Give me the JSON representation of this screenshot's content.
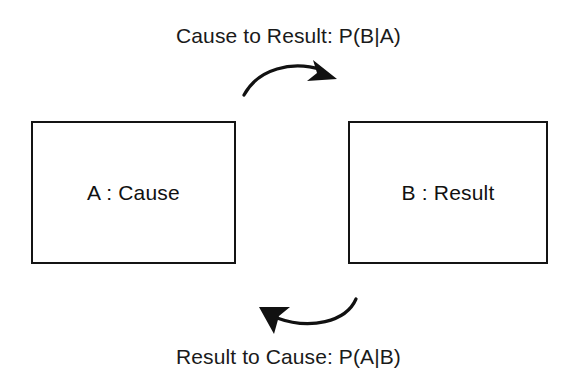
{
  "figure": {
    "background_color": "#ffffff",
    "ink_color": "#111111",
    "width": 577,
    "height": 384
  },
  "captions": {
    "top": "Cause to Result: P(B|A)",
    "bottom": "Result to Cause: P(A|B)"
  },
  "nodes": [
    {
      "id": "A",
      "label": "A : Cause",
      "role": "cause",
      "border_color": "#141414"
    },
    {
      "id": "B",
      "label": "B : Result",
      "role": "result",
      "border_color": "#141414"
    }
  ],
  "arrows": [
    {
      "id": "forward",
      "icon": "curved-arrow-right-icon",
      "from": "A",
      "to": "B",
      "direction": "left-to-right",
      "curvature": "arc-over",
      "caption_ref": "top",
      "probability": "P(B|A)"
    },
    {
      "id": "reverse",
      "icon": "curved-arrow-left-icon",
      "from": "B",
      "to": "A",
      "direction": "right-to-left",
      "curvature": "arc-under",
      "caption_ref": "bottom",
      "probability": "P(A|B)"
    }
  ]
}
